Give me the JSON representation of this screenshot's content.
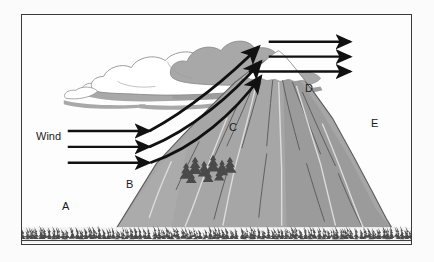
{
  "figure": {
    "frame": {
      "border_color": "#3a3a3a",
      "background_color": "#fdfdfd"
    }
  },
  "labels": {
    "wind": "Wind",
    "a": "A",
    "b": "B",
    "c": "C",
    "d": "D",
    "e": "E"
  },
  "colors": {
    "mountain_fill": "#a6a6a6",
    "mountain_shadow": "#8f8f8f",
    "mountain_outline": "#5c5c5c",
    "snow_fill": "#ffffff",
    "cloud_gray": "#a8a8a8",
    "cloud_white": "#ffffff",
    "cloud_outline": "#8a8a8a",
    "arrow_color": "#111111",
    "tree_color": "#4a4a4a",
    "ridge_line": "#595959",
    "stream_line": "#d8d8d8",
    "ground_line": "#3a3a3a"
  },
  "arrows": {
    "windward_horizontal_count": 3,
    "rising_diagonal_count": 3,
    "leeward_horizontal_count": 3
  },
  "elements": {
    "cloud_name": "cloud-mass",
    "mountain_name": "mountain",
    "snowcap_name": "snowcap",
    "foreground_forest_name": "foreground-forest",
    "slope_trees_name": "slope-tree-cluster"
  }
}
